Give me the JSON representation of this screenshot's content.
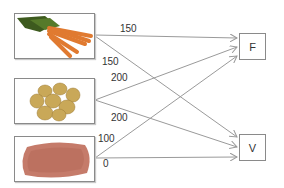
{
  "diagram": {
    "sources": [
      {
        "id": "carrots",
        "label": "carrots"
      },
      {
        "id": "potatoes",
        "label": "potatoes"
      },
      {
        "id": "ground-meat",
        "label": "ground meat"
      }
    ],
    "targets": [
      {
        "id": "F",
        "label": "F"
      },
      {
        "id": "V",
        "label": "V"
      }
    ],
    "edges": [
      {
        "from": "carrots",
        "to": "F",
        "weight": "150"
      },
      {
        "from": "carrots",
        "to": "V",
        "weight": "150"
      },
      {
        "from": "potatoes",
        "to": "F",
        "weight": "200"
      },
      {
        "from": "potatoes",
        "to": "V",
        "weight": "200"
      },
      {
        "from": "ground-meat",
        "to": "F",
        "weight": "100"
      },
      {
        "from": "ground-meat",
        "to": "V",
        "weight": "0"
      }
    ],
    "colors": {
      "edge": "#9a9a9a",
      "border": "#8a8a8a",
      "text": "#333333"
    }
  }
}
